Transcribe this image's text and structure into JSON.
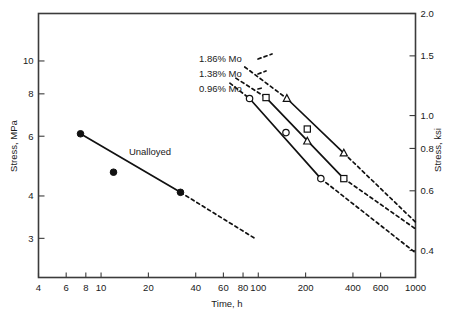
{
  "chart_data": {
    "type": "line",
    "title": "",
    "xlabel": "Time, h",
    "ylabel": "Stress, MPa",
    "y2label": "Stress, ksi",
    "xscale": "log",
    "yscale": "log",
    "xlim": [
      4,
      1000
    ],
    "ylim_mpa": [
      2.3,
      13.8
    ],
    "ylim_ksi": [
      0.333,
      2.0
    ],
    "grid": false,
    "legend": "inline-annotations",
    "xticks": [
      4,
      6,
      8,
      10,
      20,
      40,
      60,
      80,
      100,
      200,
      400,
      600,
      1000
    ],
    "xtick_labels": [
      "4",
      "6",
      "8",
      "10",
      "20",
      "40",
      "60",
      "80",
      "100",
      "200",
      "400",
      "600",
      "1000"
    ],
    "yticks_left": [
      3,
      4,
      6,
      8,
      10
    ],
    "ytick_labels_left": [
      "3",
      "4",
      "6",
      "8",
      "10"
    ],
    "yticks_right": [
      0.4,
      0.6,
      0.8,
      1.0,
      1.5,
      2.0
    ],
    "ytick_labels_right": [
      "0.4",
      "0.6",
      "0.8",
      "1.0",
      "1.5",
      "2.0"
    ],
    "annotations": [
      {
        "text": "1.86% Mo",
        "x_px": 199,
        "y_px": 62
      },
      {
        "text": "1.38% Mo",
        "x_px": 199,
        "y_px": 77
      },
      {
        "text": "0.96% Mo",
        "x_px": 199,
        "y_px": 92
      },
      {
        "text": "Unalloyed",
        "x_px": 150,
        "y_px": 155
      }
    ],
    "series": [
      {
        "name": "Unalloyed",
        "marker": "filled-circle",
        "line": "solid-with-dashed-extrapolation",
        "points": [
          {
            "x": 7.4,
            "y": 6.1
          },
          {
            "x": 12.0,
            "y": 4.7
          },
          {
            "x": 32.0,
            "y": 4.1
          }
        ],
        "fit_solid": [
          {
            "x": 7.4,
            "y": 6.1
          },
          {
            "x": 32.0,
            "y": 4.1
          }
        ],
        "fit_dashed": [
          {
            "x": 32.0,
            "y": 4.1
          },
          {
            "x": 95.0,
            "y": 3.0
          }
        ]
      },
      {
        "name": "0.96% Mo",
        "marker": "open-circle",
        "line": "solid-with-dashed-extrapolation",
        "points": [
          {
            "x": 88,
            "y": 7.75
          },
          {
            "x": 150,
            "y": 6.15
          },
          {
            "x": 250,
            "y": 4.5
          }
        ],
        "fit_solid": [
          {
            "x": 88,
            "y": 7.75
          },
          {
            "x": 250,
            "y": 4.5
          }
        ],
        "fit_dashed_low": [
          {
            "x": 250,
            "y": 4.5
          },
          {
            "x": 1000,
            "y": 2.72
          }
        ],
        "fit_dashed_high": [
          {
            "x": 66,
            "y": 8.6
          },
          {
            "x": 88,
            "y": 7.75
          }
        ]
      },
      {
        "name": "1.38% Mo",
        "marker": "open-square",
        "line": "solid-with-dashed-extrapolation",
        "points": [
          {
            "x": 112,
            "y": 7.8
          },
          {
            "x": 205,
            "y": 6.3
          },
          {
            "x": 350,
            "y": 4.5
          }
        ],
        "fit_solid": [
          {
            "x": 112,
            "y": 7.8
          },
          {
            "x": 350,
            "y": 4.5
          }
        ],
        "fit_dashed_low": [
          {
            "x": 350,
            "y": 4.5
          },
          {
            "x": 1000,
            "y": 3.2
          }
        ],
        "fit_dashed_high": [
          {
            "x": 72,
            "y": 8.9
          },
          {
            "x": 112,
            "y": 7.8
          }
        ]
      },
      {
        "name": "1.86% Mo",
        "marker": "open-triangle",
        "line": "solid-with-dashed-extrapolation",
        "points": [
          {
            "x": 152,
            "y": 7.75
          },
          {
            "x": 205,
            "y": 5.8
          },
          {
            "x": 350,
            "y": 5.35
          }
        ],
        "fit_solid": [
          {
            "x": 152,
            "y": 7.75
          },
          {
            "x": 350,
            "y": 5.35
          }
        ],
        "fit_dashed_low": [
          {
            "x": 350,
            "y": 5.35
          },
          {
            "x": 1000,
            "y": 3.35
          }
        ],
        "fit_dashed_high": [
          {
            "x": 82,
            "y": 9.6
          },
          {
            "x": 152,
            "y": 7.75
          }
        ]
      }
    ]
  },
  "axes": {
    "x_title": "Time, h",
    "y_left_title": "Stress, MPa",
    "y_right_title": "Stress, ksi"
  },
  "colors": {
    "ink": "#111111",
    "frame": "#3b3b3b",
    "background": "#ffffff"
  }
}
